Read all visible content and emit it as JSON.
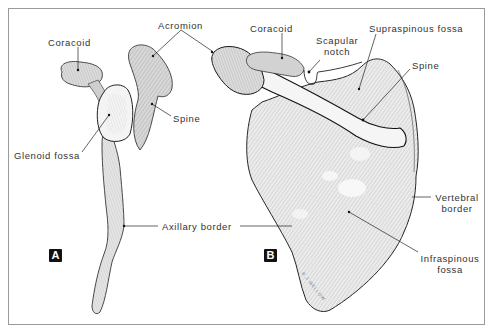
{
  "figure": {
    "panel_a": {
      "badge": "A",
      "labels": {
        "coracoid": "Coracoid",
        "acromion": "Acromion",
        "spine": "Spine",
        "glenoid_fossa": "Glenoid fossa",
        "axillary_border": "Axillary border"
      }
    },
    "panel_b": {
      "badge": "B",
      "labels": {
        "coracoid": "Coracoid",
        "scapular_notch_line1": "Scapular",
        "scapular_notch_line2": "notch",
        "supraspinous_fossa": "Supraspinous fossa",
        "spine": "Spine",
        "vertebral_border_line1": "Vertebral",
        "vertebral_border_line2": "border",
        "infraspinous_fossa_line1": "Infraspinous",
        "infraspinous_fossa_line2": "fossa"
      },
      "signature": "B J MELLOW"
    },
    "colors": {
      "ink": "#222222",
      "hatch": "#8a8a8a",
      "bone_fill": "#e9e9e9",
      "frame": "#9a9a9a",
      "background": "#ffffff"
    }
  }
}
